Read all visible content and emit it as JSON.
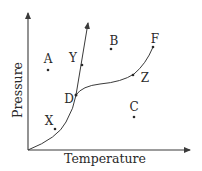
{
  "diagram": {
    "type": "phase-diagram",
    "axes": {
      "x_label": "Temperature",
      "y_label": "Pressure"
    },
    "colors": {
      "line": "#3a3a3a",
      "text": "#2a2a2a",
      "background": "#ffffff"
    },
    "curves": [
      {
        "name": "sublimation-curve",
        "from": "origin",
        "through": "X",
        "to": "D"
      },
      {
        "name": "fusion-curve",
        "from": "D",
        "through": "Y",
        "to": "arrow-top"
      },
      {
        "name": "vaporization-curve",
        "from": "D",
        "through": "Z",
        "to": "F"
      }
    ],
    "points": [
      {
        "id": "A",
        "label": "A",
        "on_curve": false
      },
      {
        "id": "B",
        "label": "B",
        "on_curve": false
      },
      {
        "id": "C",
        "label": "C",
        "on_curve": false
      },
      {
        "id": "D",
        "label": "D",
        "on_curve": true
      },
      {
        "id": "F",
        "label": "F",
        "on_curve": true
      },
      {
        "id": "X",
        "label": "X",
        "on_curve": true
      },
      {
        "id": "Y",
        "label": "Y",
        "on_curve": true
      },
      {
        "id": "Z",
        "label": "Z",
        "on_curve": true
      }
    ]
  }
}
